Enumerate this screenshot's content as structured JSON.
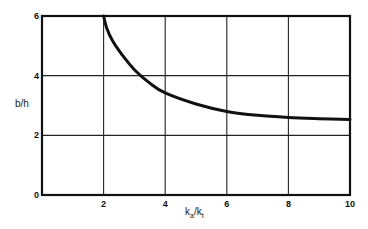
{
  "chart_data": {
    "type": "line",
    "title": "",
    "xlabel": "k_a/k_t",
    "ylabel": "b/h",
    "xlim": [
      0,
      10
    ],
    "ylim": [
      0,
      6
    ],
    "x_ticks": [
      "2",
      "4",
      "6",
      "8",
      "10"
    ],
    "y_ticks": [
      "0",
      "2",
      "4",
      "6"
    ],
    "grid": true,
    "legend": null,
    "series": [
      {
        "name": "b/h vs k_a/k_t",
        "x": [
          2.0,
          2.1,
          2.3,
          2.6,
          3.0,
          3.5,
          4.0,
          5.0,
          6.0,
          7.0,
          8.0,
          9.0,
          10.0
        ],
        "y": [
          6.0,
          5.6,
          5.15,
          4.7,
          4.2,
          3.75,
          3.42,
          3.05,
          2.8,
          2.67,
          2.6,
          2.56,
          2.53
        ]
      }
    ]
  },
  "labels": {
    "y_axis": "b/h",
    "x_axis_main_k1": "k",
    "x_axis_sub_a": "a",
    "x_axis_slash": "/k",
    "x_axis_sub_t": "t"
  }
}
